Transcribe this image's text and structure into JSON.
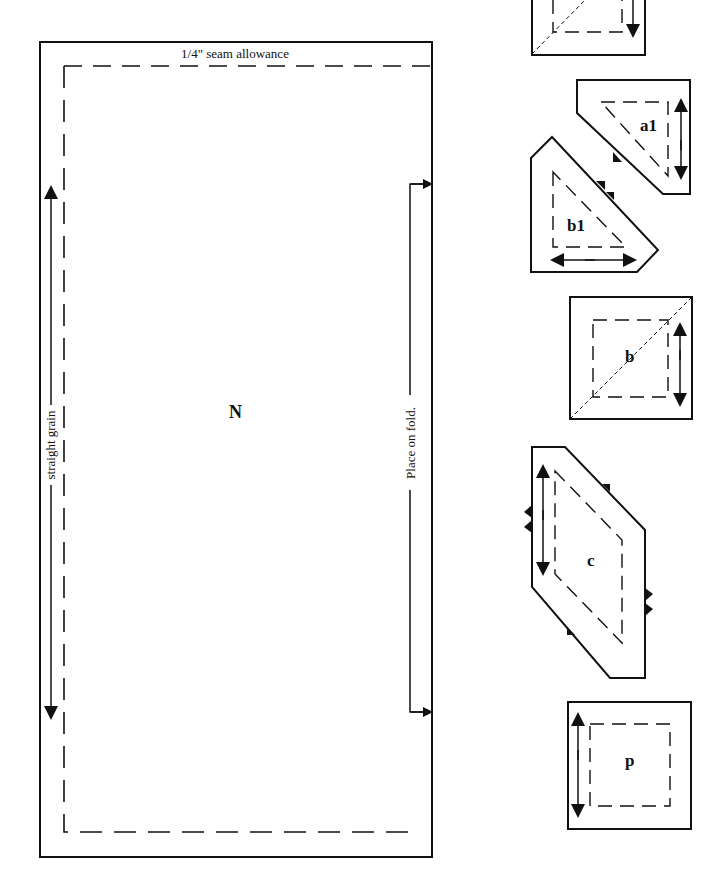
{
  "header": {
    "partial_text": "…from the edge…"
  },
  "main_pattern": {
    "piece_label": "N",
    "seam_allowance_label": "1/4\" seam allowance",
    "grain_label": "straight grain",
    "fold_label": "Place on fold."
  },
  "small_pieces": [
    {
      "id": "top-partial",
      "label": ""
    },
    {
      "id": "a1",
      "label": "a1"
    },
    {
      "id": "b1",
      "label": "b1"
    },
    {
      "id": "b",
      "label": "b"
    },
    {
      "id": "c",
      "label": "c"
    },
    {
      "id": "p",
      "label": "p"
    }
  ],
  "colors": {
    "line": "#111111",
    "background": "#ffffff"
  }
}
